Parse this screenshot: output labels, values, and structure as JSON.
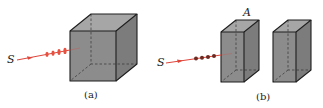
{
  "figure": {
    "panels": [
      {
        "id": "a",
        "caption": "(a)",
        "source_label": "S",
        "object": "cube",
        "wave_markers": "red-wavefront",
        "ray_color": "#e0453a"
      },
      {
        "id": "b",
        "caption": "(b)",
        "source_label": "S",
        "object_label": "A",
        "object": "two-rectangular-blocks",
        "wave_markers": "dots",
        "ray_color": "#e0453a",
        "dot_color": "#6b2a22"
      }
    ],
    "colors": {
      "block_front": "#8a8a8a",
      "block_top": "#a6a6a6",
      "block_side": "#7a7a7a",
      "edge": "#1e1e1e",
      "ray": "#e0453a"
    }
  }
}
